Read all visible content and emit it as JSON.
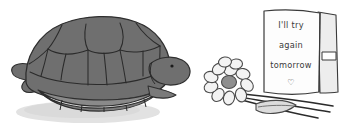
{
  "scene": {
    "title": "turtle-with-encouragement-card-illustration",
    "background_color": "#ffffff",
    "style": "hand-drawn-grayscale-sketch"
  },
  "turtle": {
    "name": "tucked-turtle",
    "shell_color": "#6f6f6f",
    "shell_shade_color": "#656565",
    "plastron_color": "#7a7a7a",
    "outline_color": "#2e2e2e",
    "head_color": "#6f6f6f",
    "eye_color": "#1c1c1c",
    "shadow_color": "#dcdcdc",
    "label": "turtle"
  },
  "card": {
    "name": "greeting-card",
    "paper_color": "#fdfdfd",
    "back_panel_color": "#f0f0f0",
    "outline_color": "#3a3a3a",
    "text_color": "#3b3b3b",
    "lines": [
      "I'll try",
      "again",
      "tomorrow"
    ],
    "symbol": "♡",
    "symbol_name": "heart-outline"
  },
  "flower": {
    "name": "daisy-flower",
    "petal_color": "#f2f2f2",
    "petal_outline_color": "#4a4a4a",
    "center_color": "#8f8f8f",
    "stem_color": "#2b2b2b",
    "leaf_color": "#d8d8d8",
    "leaf_outline_color": "#4a4a4a",
    "petal_count": 11
  }
}
